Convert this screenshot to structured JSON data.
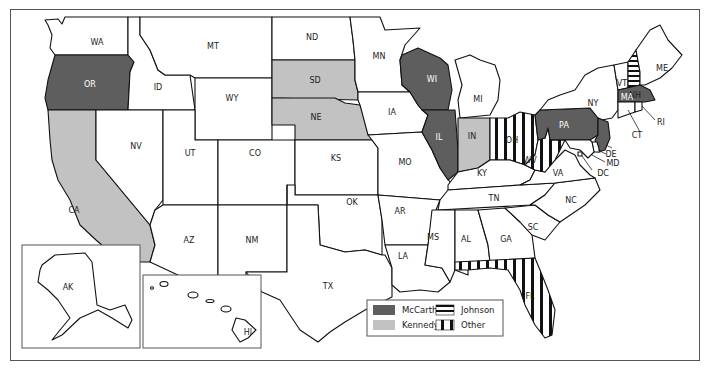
{
  "map": {
    "title": "",
    "colors": {
      "mccarthy": "#5e5e5e",
      "kennedy": "#c2c2c2",
      "none": "#ffffff",
      "stroke": "#111111"
    },
    "states": [
      {
        "abbr": "WA",
        "winner": "none"
      },
      {
        "abbr": "OR",
        "winner": "mccarthy"
      },
      {
        "abbr": "CA",
        "winner": "kennedy"
      },
      {
        "abbr": "ID",
        "winner": "none"
      },
      {
        "abbr": "NV",
        "winner": "none"
      },
      {
        "abbr": "MT",
        "winner": "none"
      },
      {
        "abbr": "WY",
        "winner": "none"
      },
      {
        "abbr": "UT",
        "winner": "none"
      },
      {
        "abbr": "CO",
        "winner": "none"
      },
      {
        "abbr": "AZ",
        "winner": "none"
      },
      {
        "abbr": "NM",
        "winner": "none"
      },
      {
        "abbr": "ND",
        "winner": "none"
      },
      {
        "abbr": "SD",
        "winner": "kennedy"
      },
      {
        "abbr": "NE",
        "winner": "kennedy"
      },
      {
        "abbr": "KS",
        "winner": "none"
      },
      {
        "abbr": "OK",
        "winner": "none"
      },
      {
        "abbr": "TX",
        "winner": "none"
      },
      {
        "abbr": "MN",
        "winner": "none"
      },
      {
        "abbr": "IA",
        "winner": "none"
      },
      {
        "abbr": "MO",
        "winner": "none"
      },
      {
        "abbr": "AR",
        "winner": "none"
      },
      {
        "abbr": "LA",
        "winner": "none"
      },
      {
        "abbr": "WI",
        "winner": "mccarthy"
      },
      {
        "abbr": "IL",
        "winner": "mccarthy"
      },
      {
        "abbr": "MI",
        "winner": "none"
      },
      {
        "abbr": "IN",
        "winner": "kennedy"
      },
      {
        "abbr": "OH",
        "winner": "other"
      },
      {
        "abbr": "KY",
        "winner": "none"
      },
      {
        "abbr": "TN",
        "winner": "none"
      },
      {
        "abbr": "MS",
        "winner": "none"
      },
      {
        "abbr": "AL",
        "winner": "none"
      },
      {
        "abbr": "GA",
        "winner": "none"
      },
      {
        "abbr": "FL",
        "winner": "other"
      },
      {
        "abbr": "SC",
        "winner": "none"
      },
      {
        "abbr": "NC",
        "winner": "none"
      },
      {
        "abbr": "VA",
        "winner": "none"
      },
      {
        "abbr": "WV",
        "winner": "other"
      },
      {
        "abbr": "PA",
        "winner": "mccarthy"
      },
      {
        "abbr": "NY",
        "winner": "none"
      },
      {
        "abbr": "NJ",
        "winner": "mccarthy"
      },
      {
        "abbr": "DE",
        "winner": "none"
      },
      {
        "abbr": "MD",
        "winner": "none"
      },
      {
        "abbr": "DC",
        "winner": "none"
      },
      {
        "abbr": "VT",
        "winner": "none"
      },
      {
        "abbr": "NH",
        "winner": "johnson"
      },
      {
        "abbr": "MA",
        "winner": "mccarthy"
      },
      {
        "abbr": "CT",
        "winner": "none"
      },
      {
        "abbr": "RI",
        "winner": "none"
      },
      {
        "abbr": "ME",
        "winner": "none"
      },
      {
        "abbr": "AK",
        "winner": "none"
      },
      {
        "abbr": "HI",
        "winner": "none"
      }
    ],
    "legend": {
      "items": [
        {
          "label": "McCarthy",
          "pattern": "mccarthy"
        },
        {
          "label": "Kennedy",
          "pattern": "kennedy"
        },
        {
          "label": "Johnson",
          "pattern": "johnson"
        },
        {
          "label": "Other",
          "pattern": "other"
        }
      ]
    }
  }
}
